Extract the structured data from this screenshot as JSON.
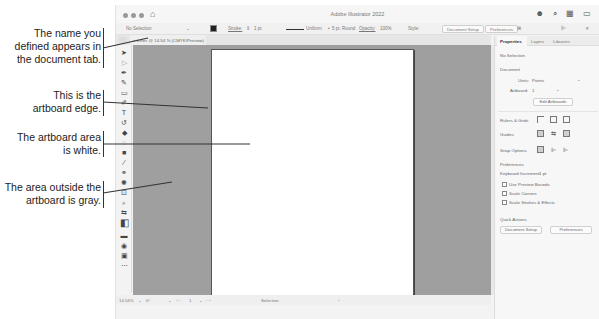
{
  "callouts": [
    {
      "text_lines": [
        "The name you",
        "defined appears in",
        "the document tab."
      ]
    },
    {
      "text_lines": [
        "This is the",
        "artboard edge."
      ]
    },
    {
      "text_lines": [
        "The artboard area",
        "is white."
      ]
    },
    {
      "text_lines": [
        "The area outside the",
        "artboard is gray."
      ]
    }
  ],
  "window": {
    "title": "Adobe Illustrator 2022",
    "home_icon": "home-icon",
    "title_icons": [
      "user-icon",
      "search-icon",
      "workspace-icon",
      "panel-icon"
    ]
  },
  "control_bar": {
    "selection": "No Selection",
    "stroke_label": "Stroke:",
    "stroke_value": "1 pt",
    "profile": "Uniform",
    "brush": "5 pt. Round",
    "opacity_label": "Opacity:",
    "opacity_value": "100%",
    "style_label": "Style:",
    "document_setup": "Document Setup",
    "preferences": "Preferences"
  },
  "document_tab": {
    "close": "×",
    "label": "Lines @ 14.54 % (CMYK/Preview)"
  },
  "tools": [
    "selection-tool",
    "direct-selection-tool",
    "pen-tool",
    "pencil-tool",
    "rectangle-tool",
    "paintbrush-tool",
    "type-tool",
    "rotate-tool",
    "eraser-tool",
    "shape-builder-tool",
    "gradient-tool",
    "eyedropper-tool",
    "blend-tool",
    "symbol-sprayer-tool",
    "artboard-tool",
    "zoom-tool",
    "swap-colors",
    "fill-stroke",
    "color-modes",
    "drawing-modes",
    "screen-mode",
    "more-tools"
  ],
  "status_bar": {
    "zoom": "14.54%",
    "rotation": "0°",
    "artboard_num": "1",
    "mode": "Selection"
  },
  "properties_panel": {
    "tabs": [
      "Properties",
      "Layers",
      "Libraries"
    ],
    "active_tab": "Properties",
    "selection_status": "No Selection",
    "document_heading": "Document",
    "units_label": "Units:",
    "units_value": "Points",
    "artboard_label": "Artboard:",
    "artboard_value": "1",
    "edit_artboards": "Edit Artboards",
    "rulers_grids_label": "Rulers & Grids",
    "guides_label": "Guides",
    "snap_options_label": "Snap Options",
    "preferences_heading": "Preferences",
    "keyboard_increment_label": "Keyboard Increment:",
    "keyboard_increment_value": "1 pt",
    "checkboxes": [
      "Use Preview Bounds",
      "Scale Corners",
      "Scale Strokes & Effects"
    ],
    "quick_actions_heading": "Quick Actions",
    "quick_buttons": [
      "Document Setup",
      "Preferences"
    ]
  },
  "colors": {
    "canvas_gray": "#9f9f9f",
    "artboard": "#ffffff",
    "ui_background": "#f3f3f3"
  }
}
